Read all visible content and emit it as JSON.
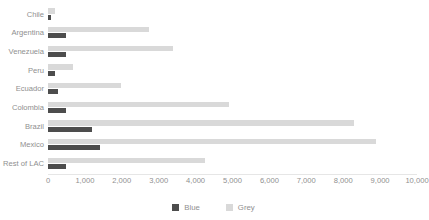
{
  "chart_data": {
    "type": "bar",
    "orientation": "horizontal",
    "title": "",
    "subtitle": "",
    "xlabel": "",
    "ylabel": "",
    "xlim": [
      0,
      10000
    ],
    "grid": false,
    "legend_position": "bottom-center",
    "categories": [
      "Chile",
      "Argentina",
      "Venezuela",
      "Peru",
      "Ecuador",
      "Colombia",
      "Brazil",
      "Mexico",
      "Rest of LAC"
    ],
    "series": [
      {
        "name": "Blue",
        "color": "#4d4d4d",
        "values": [
          80,
          480,
          500,
          180,
          270,
          500,
          1200,
          1400,
          500
        ]
      },
      {
        "name": "Grey",
        "color": "#d9d9d9",
        "values": [
          180,
          2750,
          3400,
          670,
          1980,
          4900,
          8300,
          8900,
          4250
        ]
      }
    ],
    "xticks": [
      0,
      1000,
      2000,
      3000,
      4000,
      5000,
      6000,
      7000,
      8000,
      9000,
      10000
    ],
    "xtick_labels": [
      "0",
      "1,000",
      "2,000",
      "3,000",
      "4,000",
      "5,000",
      "6,000",
      "7,000",
      "8,000",
      "9,000",
      "10,000"
    ]
  },
  "legend": {
    "items": [
      {
        "label": "Blue",
        "color": "#4d4d4d"
      },
      {
        "label": "Grey",
        "color": "#d9d9d9"
      }
    ]
  }
}
